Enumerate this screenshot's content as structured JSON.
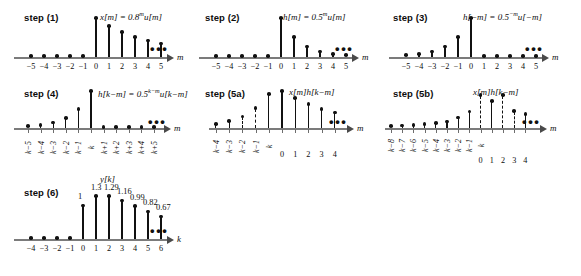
{
  "figure": {
    "background": "#ffffff",
    "stem_color": "#111111",
    "axis_color": "#7b7b7b"
  },
  "panels": [
    {
      "id": "step1",
      "step_label": "step (1)",
      "formula_html": "x[m] = 0.8<sup>m</sup>u[m]",
      "axis_var": "m",
      "chart_data": {
        "type": "stem",
        "title": "x[m] = 0.8^m u[m]",
        "xlabel": "m",
        "x": [
          -5,
          -4,
          -3,
          -2,
          -1,
          0,
          1,
          2,
          3,
          4,
          5
        ],
        "values": [
          0,
          0,
          0,
          0,
          0,
          1.0,
          0.8,
          0.64,
          0.51,
          0.41,
          0.33
        ],
        "tick_labels": [
          "−5",
          "−4",
          "−3",
          "−2",
          "−1",
          "0",
          "1",
          "2",
          "3",
          "4",
          "5"
        ],
        "dashed_stems": [],
        "ellipsis_after": true,
        "ylim": [
          0,
          1.05
        ]
      }
    },
    {
      "id": "step2",
      "step_label": "step (2)",
      "formula_html": "h[m] = 0.5<sup>m</sup>u[m]",
      "axis_var": "m",
      "chart_data": {
        "type": "stem",
        "title": "h[m] = 0.5^m u[m]",
        "xlabel": "m",
        "x": [
          -5,
          -4,
          -3,
          -2,
          -1,
          0,
          1,
          2,
          3,
          4,
          5
        ],
        "values": [
          0,
          0,
          0,
          0,
          0,
          1.0,
          0.5,
          0.25,
          0.125,
          0.0625,
          0.031
        ],
        "tick_labels": [
          "−5",
          "−4",
          "−3",
          "−2",
          "−1",
          "0",
          "1",
          "2",
          "3",
          "4",
          "5"
        ],
        "dashed_stems": [],
        "ellipsis_after": true,
        "ylim": [
          0,
          1.05
        ]
      }
    },
    {
      "id": "step3",
      "step_label": "step (3)",
      "formula_html": "h[−m] = 0.5<sup>−m</sup>u[−m]",
      "axis_var": "m",
      "chart_data": {
        "type": "stem",
        "title": "h[-m] = 0.5^-m u[-m]",
        "xlabel": "m",
        "x": [
          -5,
          -4,
          -3,
          -2,
          -1,
          0,
          1,
          2,
          3,
          4,
          5
        ],
        "values": [
          0.031,
          0.0625,
          0.125,
          0.25,
          0.5,
          1.0,
          0,
          0,
          0,
          0,
          0
        ],
        "tick_labels": [
          "−5",
          "−4",
          "−3",
          "−2",
          "−1",
          "0",
          "1",
          "2",
          "3",
          "4",
          "5"
        ],
        "dashed_stems": [],
        "ellipsis_after": true,
        "ylim": [
          0,
          1.05
        ]
      }
    },
    {
      "id": "step4",
      "step_label": "step (4)",
      "formula_html": "h[k−m] = 0.5<sup>k−m</sup>u[k−m]",
      "axis_var": "m",
      "chart_data": {
        "type": "stem",
        "title": "h[k-m] = 0.5^(k-m) u[k-m]",
        "xlabel": "m",
        "x": [
          -5,
          -4,
          -3,
          -2,
          -1,
          0,
          1,
          2,
          3,
          4,
          5
        ],
        "values": [
          0.031,
          0.0625,
          0.125,
          0.25,
          0.5,
          1.0,
          0,
          0,
          0,
          0,
          0
        ],
        "tick_labels": [
          "k−5",
          "k−4",
          "k−3",
          "k−2",
          "k−1",
          "k",
          "k+1",
          "k+2",
          "k+3",
          "k+4",
          "k+5"
        ],
        "rotated_ticks": true,
        "dashed_stems": [],
        "ellipsis_after": true,
        "ylim": [
          0,
          1.05
        ]
      }
    },
    {
      "id": "step5a",
      "step_label": "step (5a)",
      "formula_html": "x[m]h[k−m]",
      "axis_var": "m",
      "chart_data": {
        "type": "stem",
        "title": "x[m]h[k-m]",
        "xlabel": "m",
        "x": [
          -5,
          -4,
          -3,
          -2,
          -1,
          0,
          1,
          2,
          3,
          4
        ],
        "values": [
          0.09,
          0.17,
          0.3,
          0.53,
          0.92,
          1.0,
          0.8,
          0.64,
          0.51,
          0.41
        ],
        "tick_labels": [
          "k−4",
          "k−3",
          "k−2",
          "k−1",
          "k",
          "0",
          "1",
          "2",
          "3",
          "4"
        ],
        "left_tick_count": 5,
        "dashed_stems": [
          0,
          1,
          2,
          3
        ],
        "ellipsis_after": true,
        "ylim": [
          0,
          1.05
        ]
      }
    },
    {
      "id": "step5b",
      "step_label": "step (5b)",
      "formula_html": "x[m]h[k−m]",
      "axis_var": "m",
      "chart_data": {
        "type": "stem",
        "title": "x[m]h[k-m]",
        "xlabel": "m",
        "x": [
          -8,
          -7,
          -6,
          -5,
          -4,
          -3,
          -2,
          -1,
          0,
          1,
          2,
          3,
          4
        ],
        "values": [
          0.04,
          0.05,
          0.07,
          0.09,
          0.13,
          0.18,
          0.3,
          0.48,
          1.0,
          0.8,
          1.0,
          0.5,
          0.4
        ],
        "tick_labels_top": [
          "k−8",
          "k−7",
          "k−6",
          "k−5",
          "k−4",
          "k−3",
          "k−2",
          "k−1",
          "k"
        ],
        "tick_labels_bottom": [
          "0",
          "1",
          "2",
          "3",
          "4"
        ],
        "dashed_stems": [
          8,
          10,
          11
        ],
        "ellipsis_after": true,
        "ylim": [
          0,
          1.05
        ]
      }
    },
    {
      "id": "step6",
      "step_label": "step (6)",
      "series_title": "y[k]",
      "axis_var": "k",
      "chart_data": {
        "type": "stem",
        "title": "y[k]",
        "xlabel": "k",
        "x": [
          -4,
          -3,
          -2,
          -1,
          0,
          1,
          2,
          3,
          4,
          5,
          6
        ],
        "values": [
          0,
          0,
          0,
          0,
          1.0,
          1.3,
          1.29,
          1.16,
          0.99,
          0.82,
          0.67
        ],
        "tick_labels": [
          "−4",
          "−3",
          "−2",
          "−1",
          "0",
          "1",
          "2",
          "3",
          "4",
          "5",
          "6"
        ],
        "data_labels": [
          "",
          "",
          "",
          "",
          "1",
          "1.3",
          "1.29",
          "1.16",
          "0.99",
          "0.82",
          "0.67"
        ],
        "dashed_stems": [],
        "ellipsis_after": true,
        "ylim": [
          0,
          1.35
        ]
      }
    }
  ]
}
